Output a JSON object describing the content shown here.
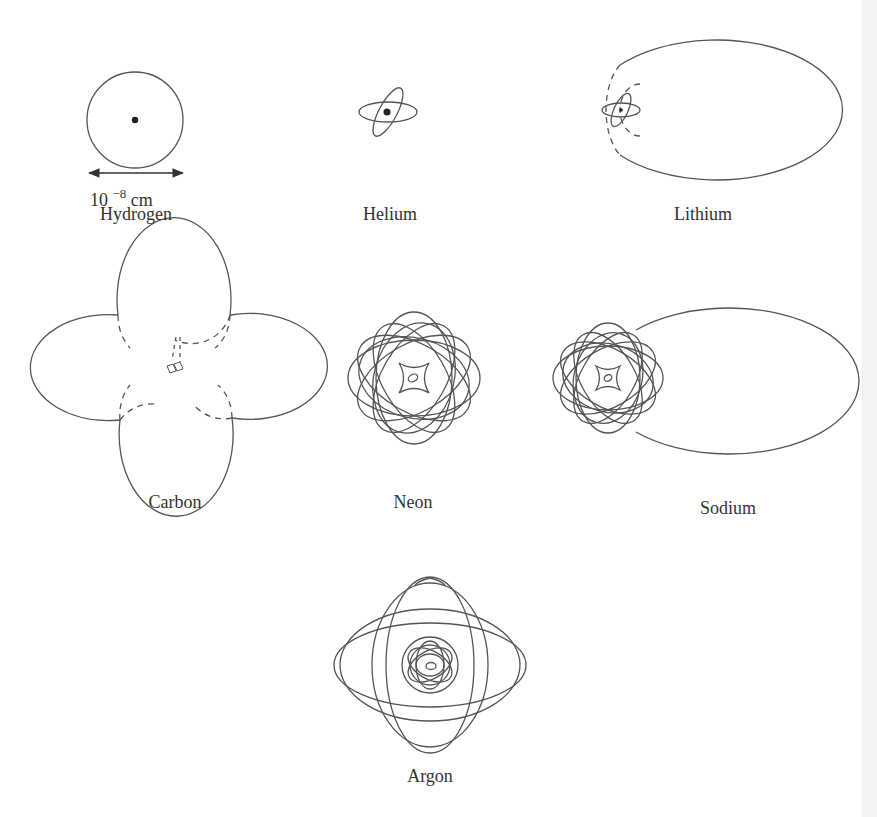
{
  "figure": {
    "atoms": [
      {
        "id": "hydrogen",
        "label": "Hydrogen"
      },
      {
        "id": "helium",
        "label": "Helium"
      },
      {
        "id": "lithium",
        "label": "Lithium"
      },
      {
        "id": "carbon",
        "label": "Carbon"
      },
      {
        "id": "neon",
        "label": "Neon"
      },
      {
        "id": "sodium",
        "label": "Sodium"
      },
      {
        "id": "argon",
        "label": "Argon"
      }
    ],
    "scale": {
      "base": "10",
      "exponent": "−8",
      "unit": "cm"
    },
    "line_color": "#555555"
  }
}
